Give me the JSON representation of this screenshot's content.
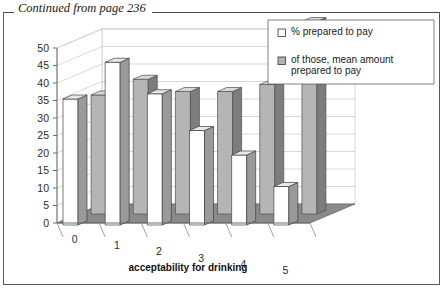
{
  "page": {
    "continued_note": "Continued from page 236"
  },
  "chart_data": {
    "type": "bar",
    "title": "",
    "xlabel": "acceptability for drinking",
    "ylabel": "",
    "categories": [
      "0",
      "1",
      "2",
      "3",
      "4",
      "5"
    ],
    "series": [
      {
        "name": "% prepared to pay",
        "color": "#ffffff",
        "values": [
          36,
          46.5,
          37.5,
          27,
          20,
          11
        ]
      },
      {
        "name": "of those, mean amount prepared to pay",
        "color": "#b3b3b3",
        "values": [
          34,
          38.5,
          35,
          35,
          37,
          55
        ]
      }
    ],
    "ylim": [
      0,
      50
    ],
    "yticks": [
      0,
      5,
      10,
      15,
      20,
      25,
      30,
      35,
      40,
      45,
      50
    ],
    "grid": true,
    "legend_position": "top-right",
    "projection": "3d"
  },
  "legend": {
    "items": [
      {
        "label": "% prepared to pay",
        "swatch": "#ffffff"
      },
      {
        "label": "of those, mean amount",
        "label2": "prepared to pay",
        "swatch": "#b3b3b3"
      }
    ]
  },
  "colors": {
    "floor": "#8a8a8a",
    "bar_white_face": "#ffffff",
    "bar_white_side": "#9a9a9a",
    "bar_white_top": "#e8e8e8",
    "bar_gray_face": "#b5b5b5",
    "bar_gray_side": "#7d7d7d",
    "bar_gray_top": "#d8d8d8",
    "grid": "#c9c9c9",
    "axis": "#6b6b6b"
  }
}
